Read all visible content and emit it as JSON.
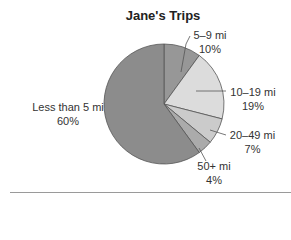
{
  "chart_data": {
    "type": "pie",
    "title": "Jane's Trips",
    "categories": [
      "5–9 mi",
      "10–19 mi",
      "20–49 mi",
      "50+ mi",
      "Less than 5 mi"
    ],
    "values": [
      10,
      19,
      7,
      4,
      60
    ],
    "unit": "%",
    "labels": [
      {
        "name": "5–9 mi",
        "pct": "10%"
      },
      {
        "name": "10–19 mi",
        "pct": "19%"
      },
      {
        "name": "20–49 mi",
        "pct": "7%"
      },
      {
        "name": "50+ mi",
        "pct": "4%"
      },
      {
        "name": "Less than 5 mi",
        "pct": "60%"
      }
    ],
    "colors": [
      "#979797",
      "#dcdcdc",
      "#cbcbcb",
      "#ababab",
      "#8c8c8c"
    ],
    "legend": "none",
    "start_angle": "12 o'clock, clockwise"
  }
}
